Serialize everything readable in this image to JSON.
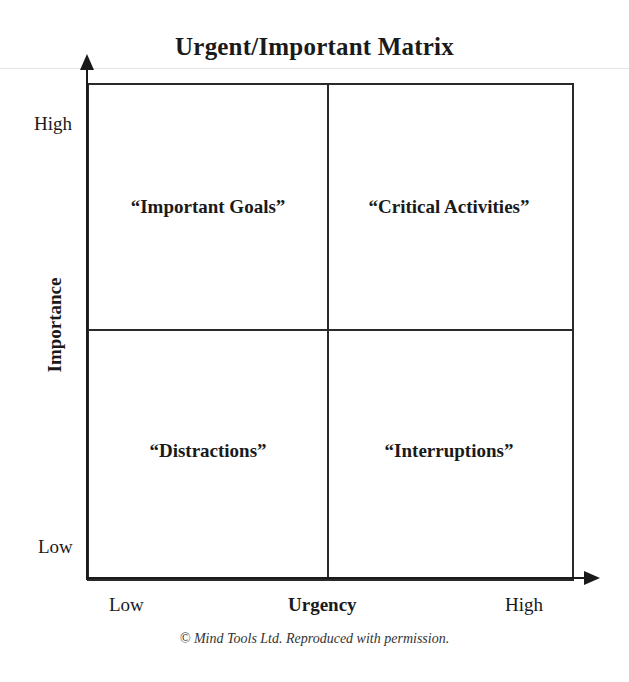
{
  "diagram": {
    "title": "Urgent/Important Matrix",
    "y_axis": {
      "label": "Importance",
      "high": "High",
      "low": "Low"
    },
    "x_axis": {
      "label": "Urgency",
      "low": "Low",
      "high": "High"
    },
    "quadrants": [
      {
        "position": "top-left",
        "label": "“Important Goals”"
      },
      {
        "position": "top-right",
        "label": "“Critical Activities”"
      },
      {
        "position": "bottom-left",
        "label": "“Distractions”"
      },
      {
        "position": "bottom-right",
        "label": "“Interruptions”"
      }
    ],
    "credit": "© Mind Tools Ltd.  Reproduced with permission."
  }
}
